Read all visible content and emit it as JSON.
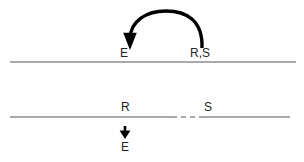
{
  "figure": {
    "kind": "molecular-strand-diagram",
    "background_color": "#ffffff",
    "stroke_color": "#8c8c8c",
    "arrow_color": "#000000",
    "text_color": "#231f20",
    "labels": {
      "top_enzyme": "E",
      "top_sites": "R,S",
      "bottom_r": "R",
      "bottom_s": "S",
      "bottom_enzyme": "E"
    },
    "icons": {
      "curved_arrow": "curved-arrow-icon",
      "down_arrow": "down-arrow-icon"
    },
    "top_strand": {
      "x_start": 10,
      "x_end": 296,
      "y": 62
    },
    "bottom_strand": {
      "x_start": 10,
      "x_end": 290,
      "y": 117,
      "dashed_gap_start": 172,
      "dashed_gap_end": 202
    }
  }
}
